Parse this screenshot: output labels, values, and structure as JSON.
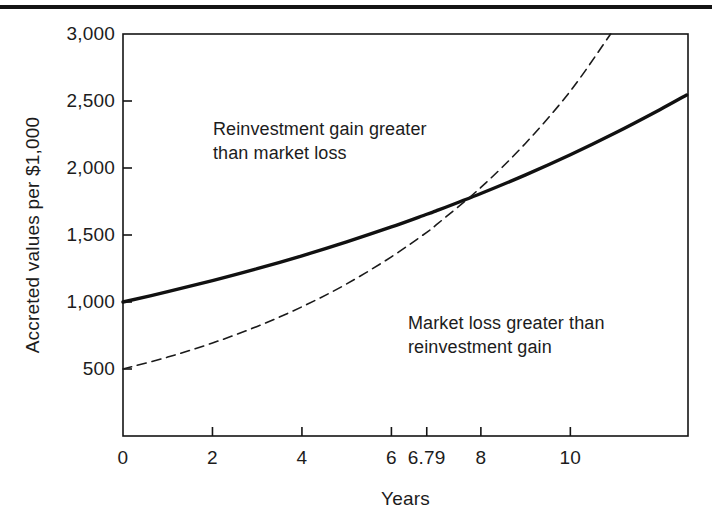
{
  "figure": {
    "page_rule": "horizontal-rule",
    "background_color": "#ffffff",
    "line_color": "#141414"
  },
  "chart_data": {
    "type": "line",
    "title": "",
    "subtitle": "",
    "xlabel": "Years",
    "ylabel": "Accreted values per $1,000",
    "xlim": [
      0,
      12.63
    ],
    "ylim": [
      0,
      3000
    ],
    "grid": false,
    "legend": "none",
    "xticks": [
      {
        "value": 0,
        "label": "0"
      },
      {
        "value": 2,
        "label": "2"
      },
      {
        "value": 4,
        "label": "4"
      },
      {
        "value": 6,
        "label": "6"
      },
      {
        "value": 6.79,
        "label": "6.79"
      },
      {
        "value": 8,
        "label": "8"
      },
      {
        "value": 10,
        "label": "10"
      }
    ],
    "yticks": [
      {
        "value": 500,
        "label": "500"
      },
      {
        "value": 1000,
        "label": "1,000"
      },
      {
        "value": 1500,
        "label": "1,500"
      },
      {
        "value": 2000,
        "label": "2,000"
      },
      {
        "value": 2500,
        "label": "2,500"
      },
      {
        "value": 3000,
        "label": "3,000"
      }
    ],
    "crossover": {
      "x": 6.79,
      "y": 1670,
      "label": "6.79"
    },
    "series": [
      {
        "name": "Accreted value (solid)",
        "style": "solid",
        "color": "#111111",
        "width": 3.4,
        "x": [
          0,
          1,
          2,
          3,
          4,
          5,
          6,
          6.79,
          7,
          8,
          9,
          10,
          11,
          12,
          12.6
        ],
        "y": [
          1000,
          1077,
          1160,
          1249,
          1345,
          1449,
          1560,
          1655,
          1680,
          1810,
          1949,
          2099,
          2261,
          2435,
          2545
        ]
      },
      {
        "name": "Market value (dashed)",
        "style": "dashed",
        "color": "#1a1a1a",
        "width": 1.6,
        "x": [
          0,
          1,
          2,
          3,
          4,
          5,
          6,
          6.79,
          7,
          8,
          9,
          10,
          10.9
        ],
        "y": [
          500,
          589,
          694,
          818,
          964,
          1135,
          1337,
          1520,
          1575,
          1855,
          2185,
          2574,
          3000
        ]
      }
    ],
    "annotations": [
      {
        "id": "upper",
        "text": "Reinvestment gain greater\nthan market loss",
        "x": 2.0,
        "y": 2350
      },
      {
        "id": "lower",
        "text": "Market loss greater than\nreinvestment gain",
        "x": 6.4,
        "y": 950
      }
    ]
  }
}
